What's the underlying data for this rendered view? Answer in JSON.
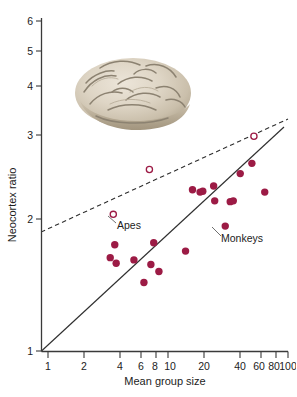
{
  "figure": {
    "title": "",
    "brain_caption": "brain-photograph"
  },
  "annotations": [
    {
      "id": "apes",
      "label": "Apes",
      "x": 10.0,
      "y": 2.1
    },
    {
      "id": "monkeys",
      "label": "Monkeys",
      "x": 39.0,
      "y": 1.86
    }
  ],
  "chart_data": {
    "type": "scatter",
    "title": "",
    "xlabel": "Mean group size",
    "ylabel": "Neocortex ratio",
    "xscale": "log",
    "yscale": "log",
    "xlim": [
      1,
      100
    ],
    "ylim": [
      1,
      6
    ],
    "grid": false,
    "legend_position": "none",
    "xticks": [
      1,
      2,
      4,
      6,
      8,
      10,
      20,
      40,
      60,
      80,
      100
    ],
    "xticklabels": [
      "1",
      "2",
      "4",
      "6",
      "8",
      "10",
      "20",
      "40",
      "60",
      "80",
      "100"
    ],
    "yticks": [
      1,
      2,
      3,
      4,
      5,
      6
    ],
    "yticklabels": [
      "1",
      "2",
      "3",
      "4",
      "5",
      "6"
    ],
    "series": [
      {
        "name": "Monkeys",
        "marker": "filled-circle",
        "color": "#9c1b45",
        "points": [
          {
            "x": 3.6,
            "y": 1.78
          },
          {
            "x": 3.3,
            "y": 1.66
          },
          {
            "x": 3.7,
            "y": 1.61
          },
          {
            "x": 5.2,
            "y": 1.64
          },
          {
            "x": 6.3,
            "y": 1.45
          },
          {
            "x": 7.6,
            "y": 1.8
          },
          {
            "x": 7.2,
            "y": 1.6
          },
          {
            "x": 8.4,
            "y": 1.54
          },
          {
            "x": 14.0,
            "y": 1.72
          },
          {
            "x": 16.0,
            "y": 2.4
          },
          {
            "x": 18.5,
            "y": 2.37
          },
          {
            "x": 19.5,
            "y": 2.38
          },
          {
            "x": 24.0,
            "y": 2.45
          },
          {
            "x": 24.5,
            "y": 2.26
          },
          {
            "x": 30.0,
            "y": 1.97
          },
          {
            "x": 33.0,
            "y": 2.25
          },
          {
            "x": 35.0,
            "y": 2.26
          },
          {
            "x": 40.0,
            "y": 2.62
          },
          {
            "x": 50.0,
            "y": 2.77
          },
          {
            "x": 64.0,
            "y": 2.37
          }
        ]
      },
      {
        "name": "Apes",
        "marker": "open-circle",
        "color": "#9c1b45",
        "points": [
          {
            "x": 3.5,
            "y": 2.1
          },
          {
            "x": 7.0,
            "y": 2.68
          },
          {
            "x": 52.0,
            "y": 3.21
          }
        ]
      }
    ],
    "fit_lines": [
      {
        "name": "monkey-regression",
        "style": "solid",
        "color": "#2f2f2f",
        "from": {
          "x": 1.0,
          "y": 1.0
        },
        "to": {
          "x": 86.0,
          "y": 3.15
        }
      },
      {
        "name": "ape-regression",
        "style": "dashed",
        "color": "#2f2f2f",
        "from": {
          "x": 1.0,
          "y": 1.76
        },
        "to": {
          "x": 92.0,
          "y": 3.35
        }
      }
    ]
  }
}
